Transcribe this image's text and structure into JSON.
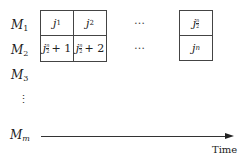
{
  "machines": [
    {
      "name": "M",
      "sub": "1"
    },
    {
      "name": "M",
      "sub": "2"
    },
    {
      "name": "M",
      "sub": "3"
    },
    {
      "name": "M",
      "sub": "m"
    }
  ],
  "vertical_ellipsis": "⋮",
  "left_block": {
    "row1": [
      {
        "var": "j",
        "sub": "1"
      },
      {
        "var": "j",
        "sub": "2"
      }
    ],
    "row2": [
      {
        "var": "j",
        "frac_num": "n",
        "frac_den": "2",
        "suffix": "+ 1"
      },
      {
        "var": "j",
        "frac_num": "n",
        "frac_den": "2",
        "suffix": "+ 2"
      }
    ]
  },
  "horizontal_ellipsis": [
    "…",
    "…"
  ],
  "right_block": {
    "row1": {
      "var": "j",
      "frac_num": "n",
      "frac_den": "2"
    },
    "row2": {
      "var": "j",
      "sub": "n"
    }
  },
  "axis": {
    "label": "Time"
  }
}
